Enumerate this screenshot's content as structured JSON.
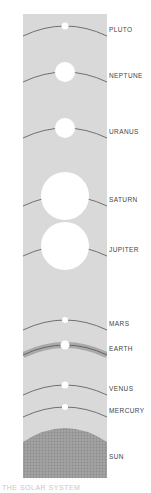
{
  "diagram": {
    "type": "solar-system-scale",
    "panel_color": "#d9d9d9",
    "orbit_line_color": "#555555",
    "planet_color": "#ffffff",
    "earth_band_color": "#a9a9a9",
    "sun_color": "#9a9a9a",
    "planets": [
      {
        "name": "PLUTO",
        "label": "PLUTO",
        "y": 26,
        "r": 3.5
      },
      {
        "name": "NEPTUNE",
        "label": "NEPTUNE",
        "y": 72,
        "r": 10
      },
      {
        "name": "URANUS",
        "label": "URANUS",
        "y": 128,
        "r": 10
      },
      {
        "name": "SATURN",
        "label": "SATURN",
        "y": 196,
        "r": 24
      },
      {
        "name": "JUPITER",
        "label": "JUPITER",
        "y": 246,
        "r": 24
      },
      {
        "name": "MARS",
        "label": "MARS",
        "y": 320,
        "r": 3
      },
      {
        "name": "EARTH",
        "label": "EARTH",
        "y": 345,
        "r": 4.5
      },
      {
        "name": "VENUS",
        "label": "VENUS",
        "y": 385,
        "r": 3.5
      },
      {
        "name": "MERCURY",
        "label": "MERCURY",
        "y": 407,
        "r": 3
      }
    ],
    "sun": {
      "label": "SUN",
      "y": 458
    }
  },
  "caption": "THE SOLAR SYSTEM"
}
